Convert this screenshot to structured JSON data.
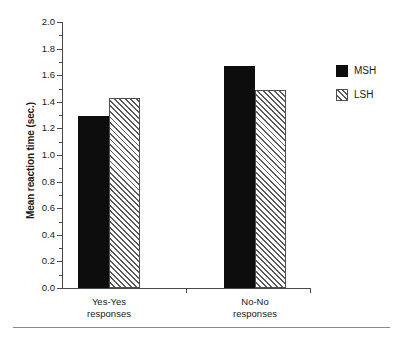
{
  "chart_data": {
    "type": "bar",
    "title": "",
    "subtitle": "",
    "xlabel": "",
    "ylabel": "Mean reaction time (sec.)",
    "categories": [
      "Yes-Yes responses",
      "No-No responses"
    ],
    "category_lines": [
      [
        "Yes-Yes",
        "responses"
      ],
      [
        "No-No",
        "responses"
      ]
    ],
    "series": [
      {
        "name": "MSH",
        "values": [
          1.29,
          1.67
        ],
        "fill": "solid-black",
        "color": "#0d0d0d"
      },
      {
        "name": "LSH",
        "values": [
          1.43,
          1.49
        ],
        "fill": "diagonal-hatch",
        "color": "#5a5a5a"
      }
    ],
    "ylim": [
      0.0,
      2.0
    ],
    "ytick_step": 0.2,
    "yticks": [
      0.0,
      0.2,
      0.4,
      0.6,
      0.8,
      1.0,
      1.2,
      1.4,
      1.6,
      1.8,
      2.0
    ],
    "ytick_labels": [
      "0.0",
      "0.2",
      "0.4",
      "0.6",
      "0.8",
      "1.0",
      "1.2",
      "1.4",
      "1.6",
      "1.8",
      "2.0"
    ],
    "yminor_ticks": [
      0.1,
      0.3,
      0.5,
      0.7,
      0.9,
      1.1,
      1.3,
      1.5,
      1.7,
      1.9
    ],
    "grid": false,
    "legend_position": "right",
    "legend_entries": [
      "MSH",
      "LSH"
    ]
  },
  "figure": {
    "y_axis_title": "Mean reaction time (sec.)",
    "bottom_rule": true
  }
}
